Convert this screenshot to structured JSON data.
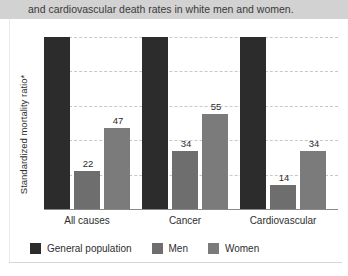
{
  "caption": {
    "text": "and cardiovascular death rates in white men and women."
  },
  "chart_data": {
    "type": "bar",
    "title": "",
    "xlabel": "",
    "ylabel": "Standardized mortality ratio*",
    "ylim": [
      0,
      100
    ],
    "yticks": [
      0,
      20,
      40,
      60,
      80,
      100
    ],
    "ytick_labels": [
      "0",
      "20",
      "40",
      "60",
      "80",
      "100"
    ],
    "grid": true,
    "legend_position": "bottom-left",
    "categories": [
      "All causes",
      "Cancer",
      "Cardiovascular"
    ],
    "series": [
      {
        "name": "General population",
        "color": "#2c2c2c",
        "values": [
          100,
          100,
          100
        ],
        "labels": [
          "",
          "",
          ""
        ]
      },
      {
        "name": "Men",
        "color": "#6e6e6e",
        "values": [
          22,
          34,
          14
        ],
        "labels": [
          "22",
          "34",
          "14"
        ]
      },
      {
        "name": "Women",
        "color": "#7b7b7b",
        "values": [
          47,
          55,
          34
        ],
        "labels": [
          "47",
          "55",
          "34"
        ]
      }
    ]
  }
}
